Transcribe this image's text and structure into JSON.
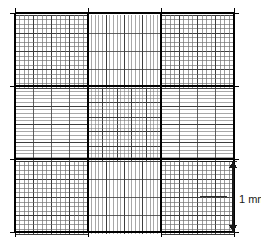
{
  "figure": {
    "background_color": "#ffffff",
    "line_color": "#000000",
    "fine_line_color": "#6e6e6e",
    "mid_line_color": "#3d3d3d"
  },
  "grid": {
    "origin_x": 15,
    "origin_y": 13,
    "size": 219,
    "major_divisions": 3,
    "major_cell": 73,
    "corner_block_divisions": 4,
    "corner_sub_divisions": 4,
    "centre_fine_divisions": 20,
    "band_fine_divisions": 20,
    "tick_overhang": 5
  },
  "scale_bar": {
    "label": "1 mm",
    "x": 233,
    "top_y": 161,
    "bottom_y": 232,
    "arrow_half_width": 4,
    "arrow_length": 7,
    "leader_top_y": 161,
    "leader_mid_y": 196,
    "leader_bottom_y": 232,
    "leader_left_x": 200,
    "label_x": 239,
    "label_y": 200,
    "color": "#1a1a1a"
  },
  "ticks": {
    "count_per_side": 4,
    "description": "Short tick marks extend beyond each side of the ruled area at the major grid line positions."
  }
}
